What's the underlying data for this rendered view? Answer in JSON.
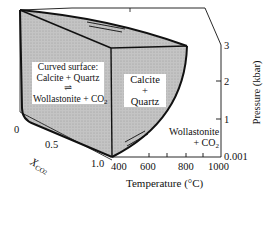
{
  "figure": {
    "type": "3D phase diagram (P-T-X block)",
    "shading_color": "#bdbdbd",
    "line_color": "#111111",
    "background": "#ffffff"
  },
  "labels": {
    "curved_surface_title": "Curved surface:",
    "curved_surface_reaction_left": "Calcite + Quartz",
    "equilibrium_arrows": "⇌",
    "curved_surface_reaction_right": "Wollastonite + CO",
    "co2_subscript": "2",
    "front_field_line1": "Calcite",
    "front_field_line2": "+",
    "front_field_line3": "Quartz",
    "right_field_line1": "Wollastonite",
    "right_field_line2": "+ CO",
    "right_field_sub": "2"
  },
  "axes": {
    "pressure": {
      "title": "Pressure (kbar)",
      "ticks": [
        "3",
        "2",
        "1",
        "0.001"
      ]
    },
    "temperature": {
      "title": "Temperature (°C)",
      "ticks": [
        "400",
        "600",
        "800",
        "1000"
      ]
    },
    "xco2": {
      "title_main": "X",
      "title_sub": "CO",
      "title_subsub": "2",
      "ticks": [
        "0",
        "0.5",
        "1.0"
      ]
    }
  }
}
